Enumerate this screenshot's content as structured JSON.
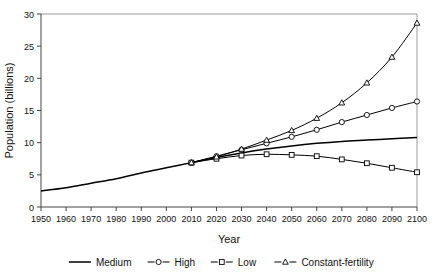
{
  "chart_data": {
    "type": "line",
    "title": "",
    "xlabel": "Year",
    "ylabel": "Population (billions)",
    "xlim": [
      1950,
      2100
    ],
    "ylim": [
      0,
      30
    ],
    "xticks": [
      1950,
      1960,
      1970,
      1980,
      1990,
      2000,
      2010,
      2020,
      2030,
      2040,
      2050,
      2060,
      2070,
      2080,
      2090,
      2100
    ],
    "yticks": [
      0,
      5,
      10,
      15,
      20,
      25,
      30
    ],
    "grid": false,
    "legend_position": "bottom",
    "x": [
      1950,
      1960,
      1970,
      1980,
      1990,
      2000,
      2010,
      2020,
      2030,
      2040,
      2050,
      2060,
      2070,
      2080,
      2090,
      2100
    ],
    "series": [
      {
        "name": "Medium",
        "marker": "none",
        "color": "#000000",
        "values": [
          2.5,
          3.0,
          3.7,
          4.4,
          5.3,
          6.1,
          6.9,
          7.7,
          8.4,
          9.0,
          9.5,
          9.9,
          10.2,
          10.4,
          10.6,
          10.8
        ]
      },
      {
        "name": "High",
        "marker": "circle",
        "color": "#000000",
        "values": [
          null,
          null,
          null,
          null,
          null,
          null,
          6.9,
          7.9,
          8.9,
          9.9,
          10.9,
          12.0,
          13.2,
          14.3,
          15.4,
          16.4
        ]
      },
      {
        "name": "Low",
        "marker": "square",
        "color": "#000000",
        "values": [
          null,
          null,
          null,
          null,
          null,
          null,
          6.9,
          7.5,
          8.0,
          8.2,
          8.1,
          7.9,
          7.4,
          6.8,
          6.1,
          5.4
        ]
      },
      {
        "name": "Constant-fertility",
        "marker": "triangle",
        "color": "#000000",
        "values": [
          null,
          null,
          null,
          null,
          null,
          null,
          6.9,
          7.8,
          9.0,
          10.4,
          11.9,
          13.8,
          16.2,
          19.3,
          23.3,
          28.6
        ]
      }
    ]
  },
  "legend": {
    "items": [
      {
        "label": "Medium",
        "marker": "none"
      },
      {
        "label": "High",
        "marker": "circle"
      },
      {
        "label": "Low",
        "marker": "square"
      },
      {
        "label": "Constant-fertility",
        "marker": "triangle"
      }
    ]
  },
  "axis": {
    "x_title": "Year",
    "y_title": "Population (billions)"
  }
}
